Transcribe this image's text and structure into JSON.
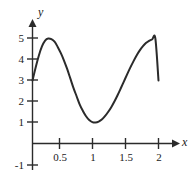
{
  "chart_data": {
    "type": "line",
    "title": "",
    "xlabel": "x",
    "ylabel": "y",
    "xlim": [
      -0.05,
      2.15
    ],
    "ylim": [
      -1.35,
      5.6
    ],
    "grid": false,
    "legend": null,
    "xticks": [
      0.5,
      1,
      1.5,
      2
    ],
    "xticklabels": [
      "0.5",
      "1",
      "1.5",
      "2"
    ],
    "yticks": [
      -1,
      1,
      2,
      3,
      4,
      5
    ],
    "yticklabels": [
      "-1",
      "1",
      "2",
      "3",
      "4",
      "5"
    ],
    "series": [
      {
        "name": "curve",
        "color": "#2b2b2b",
        "linewidth": 2,
        "x": [
          0,
          0.05,
          0.1,
          0.15,
          0.2,
          0.25,
          0.3,
          0.35,
          0.4,
          0.45,
          0.5,
          0.55,
          0.6,
          0.65,
          0.7,
          0.75,
          0.8,
          0.85,
          0.9,
          0.95,
          1,
          1.05,
          1.1,
          1.15,
          1.2,
          1.25,
          1.3,
          1.35,
          1.4,
          1.45,
          1.5,
          1.55,
          1.6,
          1.65,
          1.7,
          1.75,
          1.8,
          1.85,
          1.9,
          1.95,
          2
        ],
        "y": [
          3,
          3.62,
          4.18,
          4.62,
          4.9,
          5,
          4.97,
          4.85,
          4.6,
          4.3,
          3.95,
          3.55,
          3.1,
          2.65,
          2.25,
          1.85,
          1.55,
          1.3,
          1.12,
          1.02,
          1,
          1.04,
          1.14,
          1.3,
          1.5,
          1.73,
          2,
          2.3,
          2.62,
          2.95,
          3.28,
          3.6,
          3.9,
          4.18,
          4.42,
          4.62,
          4.78,
          4.89,
          4.96,
          5,
          3
        ]
      }
    ],
    "annotations": {
      "peak": {
        "x": 0.5,
        "y": 5
      },
      "trough": {
        "x": 1.5,
        "y": 1
      },
      "y_intercept": {
        "x": 0,
        "y": 3
      },
      "right_end": {
        "x": 2,
        "y": 3
      }
    }
  },
  "axes": {
    "x_axis_name": "x",
    "y_axis_name": "y"
  }
}
